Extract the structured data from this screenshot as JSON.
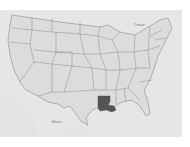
{
  "map": {
    "title": "",
    "region": "United States",
    "highlighted_state": "Louisiana",
    "labels": {
      "north": "Canada",
      "south": "Mexico"
    },
    "colors": {
      "background": "#ffffff",
      "land": "#dcdcdc",
      "water": "#ececec",
      "borders": "#8a8a8a",
      "highlight": "#555555"
    }
  }
}
